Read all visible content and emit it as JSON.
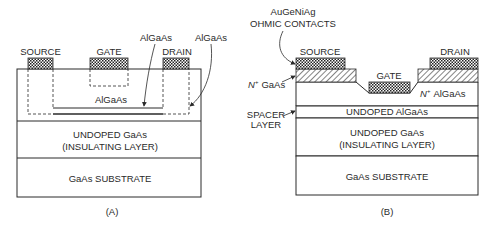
{
  "diagram": {
    "type": "cross-section",
    "panels": [
      {
        "id": "A",
        "caption": "(A)",
        "terminals": {
          "source": "SOURCE",
          "gate": "GATE",
          "drain": "DRAIN"
        },
        "callouts": {
          "algaas_channel": "AlGaAs",
          "algaas_region": "AlGaAs"
        },
        "layers": {
          "active": "AlGaAs",
          "insulating_line1": "UNDOPED GaAs",
          "insulating_line2": "(INSULATING LAYER)",
          "substrate": "GaAs SUBSTRATE"
        }
      },
      {
        "id": "B",
        "caption": "(B)",
        "terminals": {
          "source": "SOURCE",
          "gate": "GATE",
          "drain": "DRAIN"
        },
        "callouts": {
          "ohmic_line1": "AuGeNiAg",
          "ohmic_line2": "OHMIC CONTACTS",
          "n_gaas_sup": "N",
          "n_gaas_plus": "+",
          "n_gaas_text": "GaAs",
          "spacer_line1": "SPACER",
          "spacer_line2": "LAYER"
        },
        "layers": {
          "n_algaas_sup": "N",
          "n_algaas_plus": "+",
          "n_algaas_text": "AlGaAs",
          "spacer": "UNDOPED AlGaAs",
          "insulating_line1": "UNDOPED GaAs",
          "insulating_line2": "(INSULATING LAYER)",
          "substrate": "GaAs SUBSTRATE"
        }
      }
    ]
  },
  "colors": {
    "line": "#2a2a2a",
    "background": "#ffffff",
    "contact_fill": "#8a8a8a"
  }
}
